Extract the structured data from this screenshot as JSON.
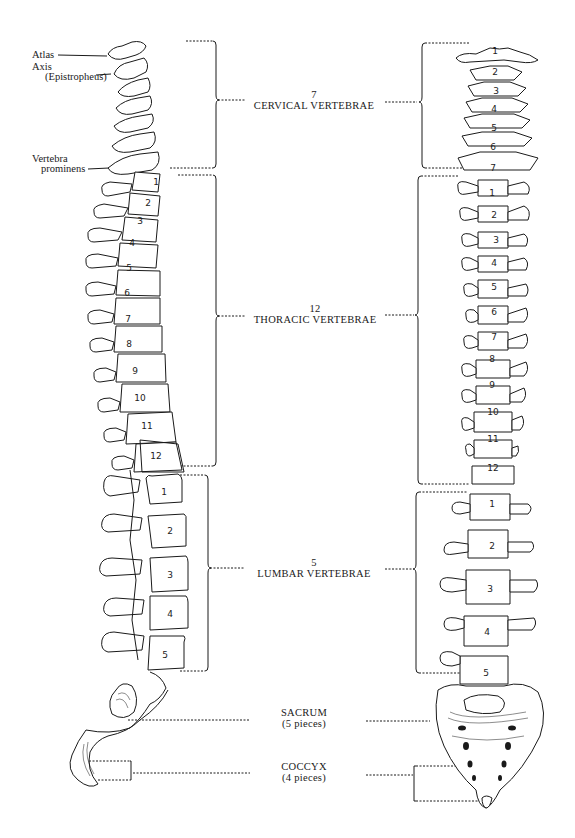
{
  "left_labels": {
    "atlas": "Atlas",
    "axis": "Axis",
    "epistropheus": "(Epistropheus)",
    "vertebra": "Vertebra",
    "prominens": "prominens"
  },
  "regions": {
    "cervical": {
      "count": "7",
      "name": "CERVICAL VERTEBRAE"
    },
    "thoracic": {
      "count": "12",
      "name": "THORACIC VERTEBRAE"
    },
    "lumbar": {
      "count": "5",
      "name": "LUMBAR VERTEBRAE"
    },
    "sacrum": {
      "name": "SACRUM",
      "detail": "(5 pieces)"
    },
    "coccyx": {
      "name": "COCCYX",
      "detail": "(4 pieces)"
    }
  },
  "lateral_view": {
    "cervical_numbers": [],
    "thoracic_numbers": [
      "1",
      "2",
      "3",
      "4",
      "5",
      "6",
      "7",
      "8",
      "9",
      "10",
      "11",
      "12"
    ],
    "lumbar_numbers": [
      "1",
      "2",
      "3",
      "4",
      "5"
    ]
  },
  "anterior_view": {
    "cervical_numbers": [
      "1",
      "2",
      "3",
      "4",
      "5",
      "6",
      "7"
    ],
    "thoracic_numbers": [
      "1",
      "2",
      "3",
      "4",
      "5",
      "6",
      "7",
      "8",
      "9",
      "10",
      "11",
      "12"
    ],
    "lumbar_numbers": [
      "1",
      "2",
      "3",
      "4",
      "5"
    ]
  },
  "colors": {
    "ink": "#1a1a1a",
    "background": "#ffffff"
  }
}
